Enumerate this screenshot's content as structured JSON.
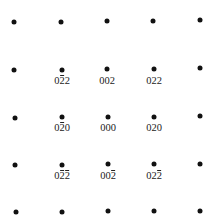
{
  "diagram": {
    "type": "electron-diffraction-pattern",
    "spots": [
      {
        "x": 14,
        "y": 22
      },
      {
        "x": 61,
        "y": 22
      },
      {
        "x": 107,
        "y": 21
      },
      {
        "x": 153,
        "y": 21
      },
      {
        "x": 200,
        "y": 20
      },
      {
        "x": 14,
        "y": 70
      },
      {
        "x": 62,
        "y": 70
      },
      {
        "x": 107,
        "y": 69
      },
      {
        "x": 154,
        "y": 69
      },
      {
        "x": 200,
        "y": 68
      },
      {
        "x": 15,
        "y": 118
      },
      {
        "x": 62,
        "y": 117
      },
      {
        "x": 108,
        "y": 117
      },
      {
        "x": 154,
        "y": 117
      },
      {
        "x": 200,
        "y": 116
      },
      {
        "x": 15,
        "y": 165
      },
      {
        "x": 62,
        "y": 165
      },
      {
        "x": 108,
        "y": 164
      },
      {
        "x": 154,
        "y": 164
      },
      {
        "x": 200,
        "y": 164
      },
      {
        "x": 16,
        "y": 212
      },
      {
        "x": 62,
        "y": 212
      },
      {
        "x": 108,
        "y": 211
      },
      {
        "x": 154,
        "y": 211
      },
      {
        "x": 200,
        "y": 211
      }
    ],
    "labels": [
      {
        "x": 62,
        "y": 76,
        "text": "0̅2̅2",
        "digits": [
          {
            "d": "0",
            "bar": false
          },
          {
            "d": "2",
            "bar": true
          },
          {
            "d": "2",
            "bar": false
          }
        ]
      },
      {
        "x": 107,
        "y": 76,
        "text": "002",
        "digits": [
          {
            "d": "0",
            "bar": false
          },
          {
            "d": "0",
            "bar": false
          },
          {
            "d": "2",
            "bar": false
          }
        ]
      },
      {
        "x": 154,
        "y": 76,
        "text": "022",
        "digits": [
          {
            "d": "0",
            "bar": false
          },
          {
            "d": "2",
            "bar": false
          },
          {
            "d": "2",
            "bar": false
          }
        ]
      },
      {
        "x": 62,
        "y": 123,
        "text": "0-20",
        "digits": [
          {
            "d": "0",
            "bar": false
          },
          {
            "d": "2",
            "bar": true
          },
          {
            "d": "0",
            "bar": false
          }
        ]
      },
      {
        "x": 108,
        "y": 123,
        "text": "000",
        "digits": [
          {
            "d": "0",
            "bar": false
          },
          {
            "d": "0",
            "bar": false
          },
          {
            "d": "0",
            "bar": false
          }
        ]
      },
      {
        "x": 154,
        "y": 123,
        "text": "020",
        "digits": [
          {
            "d": "0",
            "bar": false
          },
          {
            "d": "2",
            "bar": false
          },
          {
            "d": "0",
            "bar": false
          }
        ]
      },
      {
        "x": 62,
        "y": 171,
        "text": "0-2-2",
        "digits": [
          {
            "d": "0",
            "bar": false
          },
          {
            "d": "2",
            "bar": true
          },
          {
            "d": "2",
            "bar": true
          }
        ]
      },
      {
        "x": 108,
        "y": 171,
        "text": "00-2",
        "digits": [
          {
            "d": "0",
            "bar": false
          },
          {
            "d": "0",
            "bar": false
          },
          {
            "d": "2",
            "bar": true
          }
        ]
      },
      {
        "x": 154,
        "y": 171,
        "text": "02-2",
        "digits": [
          {
            "d": "0",
            "bar": false
          },
          {
            "d": "2",
            "bar": false
          },
          {
            "d": "2",
            "bar": true
          }
        ]
      }
    ]
  }
}
